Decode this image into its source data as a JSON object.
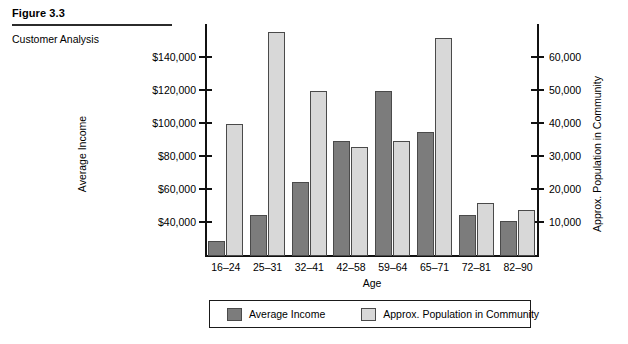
{
  "figure": {
    "number": "Figure 3.3",
    "caption": "Customer Analysis"
  },
  "chart_data": {
    "type": "bar",
    "title": "Customer Analysis",
    "xlabel": "Age",
    "categories": [
      "16–24",
      "25–31",
      "32–41",
      "42–58",
      "59–64",
      "65–71",
      "72–81",
      "82–90"
    ],
    "series": [
      {
        "name": "Average Income",
        "axis": "left",
        "color": "#7c7c7c",
        "values": [
          29000,
          45000,
          65000,
          90000,
          120000,
          95000,
          45000,
          41000
        ]
      },
      {
        "name": "Approx. Population in Community",
        "axis": "right",
        "color": "#d8d8d8",
        "values": [
          40000,
          68000,
          50000,
          33000,
          35000,
          66000,
          16000,
          14000
        ]
      }
    ],
    "left_axis": {
      "label": "Average Income",
      "ticks": [
        "$40,000",
        "$60,000",
        "$80,000",
        "$100,000",
        "$120,000",
        "$140,000"
      ],
      "tick_values": [
        40000,
        60000,
        80000,
        100000,
        120000,
        140000
      ],
      "min": 20000,
      "max": 160000
    },
    "right_axis": {
      "label": "Approx. Population in Community",
      "ticks": [
        "10,000",
        "20,000",
        "30,000",
        "40,000",
        "50,000",
        "60,000"
      ],
      "tick_values": [
        10000,
        20000,
        30000,
        40000,
        50000,
        60000
      ],
      "min": 0,
      "max": 70000
    },
    "grid": false,
    "legend_position": "bottom"
  },
  "legend": {
    "income_label": "Average Income",
    "population_label": "Approx. Population in Community"
  }
}
